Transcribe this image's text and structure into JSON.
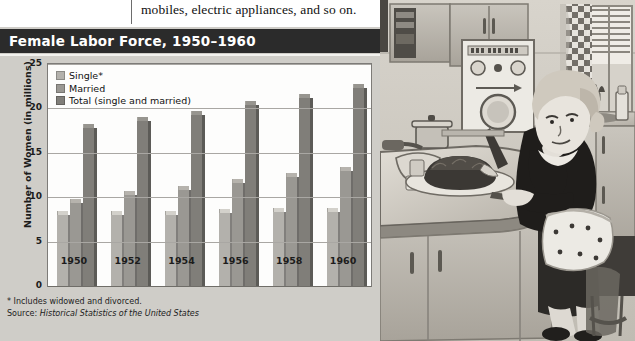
{
  "page": {
    "body_text": "mobiles, electric appliances, and so on."
  },
  "chart": {
    "title": "Female Labor Force, 1950–1960",
    "footnote": "* Includes widowed and divorced.",
    "source_prefix": "Source: ",
    "source_title": "Historical Statistics of the United States",
    "colors": {
      "title_bar_bg": "#2b2b2b",
      "title_bar_text": "#ffffff",
      "panel_bg": "#cfcdc8",
      "plot_bg": "#fdfdfc",
      "gridline": "#a9a7a3",
      "single": "#b3b1ac",
      "married": "#9a9893",
      "total": "#807e79"
    }
  },
  "chart_data": {
    "type": "bar",
    "title": "Female Labor Force, 1950–1960",
    "xlabel": "",
    "ylabel": "Number of Women (in millions)",
    "categories": [
      "1950",
      "1952",
      "1954",
      "1956",
      "1958",
      "1960"
    ],
    "series": [
      {
        "name": "Single*",
        "color": "#b3b1ac",
        "values": [
          8.0,
          8.0,
          8.0,
          8.2,
          8.3,
          8.3
        ]
      },
      {
        "name": "Married",
        "color": "#9a9893",
        "values": [
          9.3,
          10.3,
          10.8,
          11.6,
          12.3,
          13.0
        ]
      },
      {
        "name": "Total (single and married)",
        "color": "#807e79",
        "values": [
          17.8,
          18.6,
          19.3,
          20.4,
          21.2,
          22.3
        ]
      }
    ],
    "ylim": [
      0,
      25
    ],
    "yticks": [
      0,
      5,
      10,
      15,
      20,
      25
    ],
    "ytick_labels": [
      "0",
      "5",
      "10",
      "15",
      "20",
      "25"
    ],
    "grid": true,
    "legend": [
      "Single*",
      "Married",
      "Total (single and married)"
    ],
    "legend_position": "top-left-inside"
  },
  "photo": {
    "caption_name": "1950s-kitchen-illustration",
    "description": "Black-and-white illustration of a 1950s housewife seated at a kitchen counter, resting her chin on her hand beside a cake, with a washing machine and checkered curtains behind her."
  }
}
